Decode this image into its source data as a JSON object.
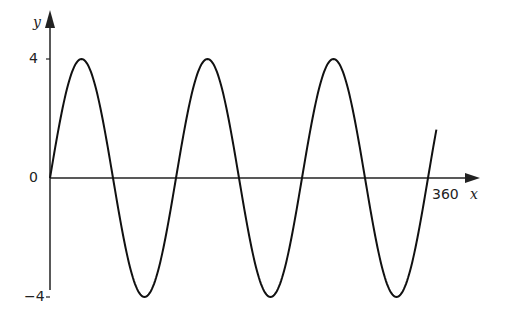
{
  "chart_data": {
    "type": "line",
    "title": "",
    "function": "y = 4 sin(3x)",
    "xlabel": "x",
    "ylabel": "y",
    "x_range": [
      0,
      360
    ],
    "ylim": [
      -4,
      4
    ],
    "y_ticks": [
      "4",
      "0",
      "−4"
    ],
    "x_tick_labels": [
      "360"
    ],
    "grid": false,
    "series": [
      {
        "name": "y = 4 sin 3x",
        "x": [
          0,
          30,
          60,
          90,
          120,
          150,
          180,
          210,
          240,
          270,
          300,
          330,
          360
        ],
        "values": [
          0,
          4,
          0,
          -4,
          0,
          4,
          0,
          -4,
          0,
          4,
          0,
          -4,
          0
        ]
      }
    ]
  },
  "labels": {
    "y_axis": "y",
    "x_axis": "x",
    "y_top": "4",
    "y_zero": "0",
    "y_bottom": "−4",
    "x_end": "360"
  }
}
